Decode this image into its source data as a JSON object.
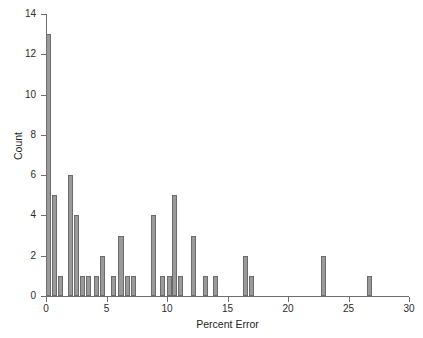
{
  "chart_data": {
    "type": "bar",
    "title": "",
    "subtitle": "",
    "xlabel": "Percent Error",
    "ylabel": "Count",
    "xlim": [
      0,
      30
    ],
    "ylim": [
      0,
      14
    ],
    "xticks": [
      0,
      5,
      10,
      15,
      20,
      25,
      30
    ],
    "xticklabels": [
      "0",
      "5",
      "10",
      "15",
      "20",
      "25",
      "30"
    ],
    "yticks": [
      0,
      2,
      4,
      6,
      8,
      10,
      12,
      14
    ],
    "yticklabels": [
      "0",
      "2",
      "4",
      "6",
      "8",
      "10",
      "12",
      "14"
    ],
    "grid": false,
    "legend": null,
    "bar_color": "#9a9a9a",
    "bar_edge_color": "#6b6b6b",
    "axis_color": "#6e6e6e",
    "bar_width": 0.42,
    "categories": [
      0.2,
      0.7,
      1.2,
      2.0,
      2.5,
      3.0,
      3.5,
      4.2,
      4.7,
      5.6,
      6.2,
      6.7,
      7.2,
      8.9,
      9.6,
      10.2,
      10.6,
      11.1,
      12.2,
      13.2,
      14.0,
      16.5,
      17.0,
      22.9,
      26.7
    ],
    "values": [
      13,
      5,
      1,
      6,
      4,
      1,
      1,
      1,
      2,
      1,
      3,
      1,
      1,
      4,
      1,
      1,
      5,
      1,
      3,
      1,
      1,
      2,
      1,
      2,
      1
    ],
    "annotations": []
  }
}
